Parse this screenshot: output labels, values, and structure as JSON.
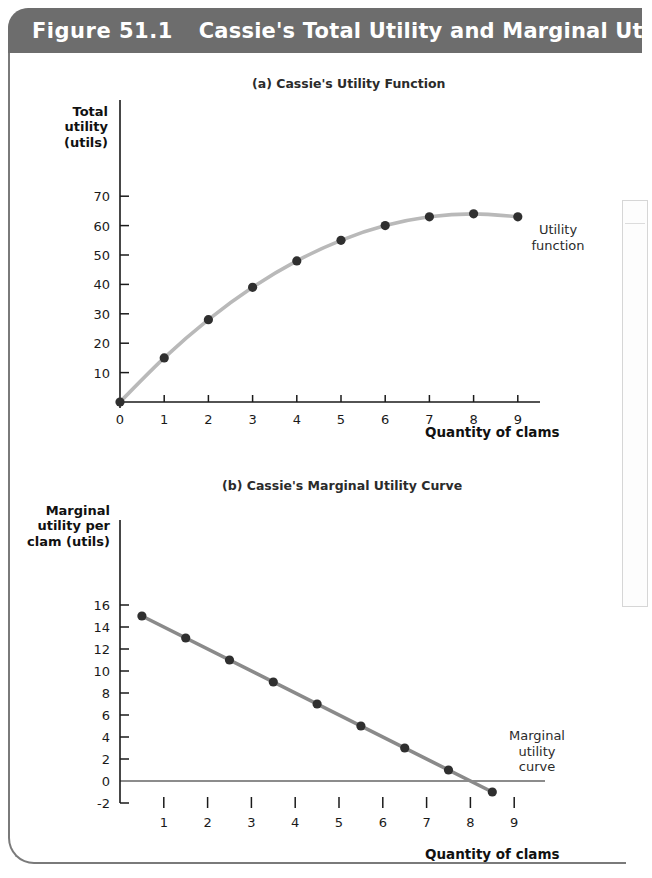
{
  "header": {
    "figure_number": "Figure 51.1",
    "title": "Cassie's Total Utility and Marginal Utility",
    "bar_color": "#6d6d6d",
    "text_color": "#ffffff"
  },
  "panel_a": {
    "caption": "(a) Cassie's Utility Function",
    "y_axis_title": "Total\nutility\n(utils)",
    "x_axis_title": "Quantity of clams",
    "curve_label": "Utility\nfunction",
    "curve_color": "#b9b9b9",
    "point_color": "#2f2f2f"
  },
  "panel_b": {
    "caption": "(b) Cassie's Marginal Utility Curve",
    "y_axis_title": "Marginal\nutility per\nclam (utils)",
    "x_axis_title": "Quantity of clams",
    "curve_label": "Marginal\nutility\ncurve",
    "curve_color": "#8a8a8a",
    "point_color": "#2f2f2f"
  },
  "chart_data": [
    {
      "type": "line",
      "id": "total-utility",
      "title": "(a) Cassie's Utility Function",
      "xlabel": "Quantity of clams",
      "ylabel": "Total utility (utils)",
      "xlim": [
        0,
        9.6
      ],
      "ylim": [
        0,
        75
      ],
      "xticks": [
        0,
        1,
        2,
        3,
        4,
        5,
        6,
        7,
        8,
        9
      ],
      "xticklabels": [
        "0",
        "1",
        "2",
        "3",
        "4",
        "5",
        "6",
        "7",
        "8",
        "9"
      ],
      "yticks": [
        10,
        20,
        30,
        40,
        50,
        60,
        70
      ],
      "yticklabels": [
        "10",
        "20",
        "30",
        "40",
        "50",
        "60",
        "70"
      ],
      "grid": false,
      "legend": "none",
      "annotations": [
        "Utility function"
      ],
      "series": [
        {
          "name": "Utility function",
          "x": [
            0,
            1,
            2,
            3,
            4,
            5,
            6,
            7,
            8,
            9
          ],
          "values": [
            0,
            15,
            28,
            39,
            48,
            55,
            60,
            63,
            64,
            63
          ]
        }
      ]
    },
    {
      "type": "line",
      "id": "marginal-utility",
      "title": "(b) Cassie's Marginal Utility Curve",
      "xlabel": "Quantity of clams",
      "ylabel": "Marginal utility per clam (utils)",
      "xlim": [
        0,
        9.6
      ],
      "ylim": [
        -2,
        16
      ],
      "xticks": [
        1,
        2,
        3,
        4,
        5,
        6,
        7,
        8,
        9
      ],
      "xticklabels": [
        "1",
        "2",
        "3",
        "4",
        "5",
        "6",
        "7",
        "8",
        "9"
      ],
      "yticks": [
        -2,
        0,
        2,
        4,
        6,
        8,
        10,
        12,
        14,
        16
      ],
      "yticklabels": [
        "-2",
        "0",
        "2",
        "4",
        "6",
        "8",
        "10",
        "12",
        "14",
        "16"
      ],
      "grid": false,
      "legend": "none",
      "annotations": [
        "Marginal utility curve"
      ],
      "series": [
        {
          "name": "Marginal utility curve",
          "x": [
            0.5,
            1.5,
            2.5,
            3.5,
            4.5,
            5.5,
            6.5,
            7.5,
            8.5
          ],
          "values": [
            15,
            13,
            11,
            9,
            7,
            5,
            3,
            1,
            -1
          ]
        }
      ]
    }
  ]
}
